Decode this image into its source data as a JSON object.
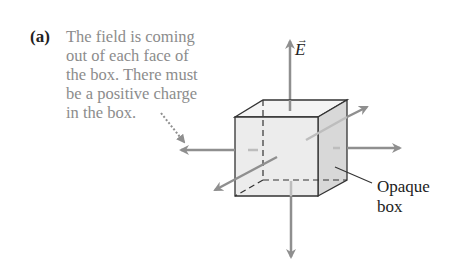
{
  "figure": {
    "panel_label": "(a)",
    "caption_lines": [
      "The field is coming",
      "out of each face of",
      "the box. There must",
      "be a positive charge",
      "in the box."
    ],
    "field_symbol": "E",
    "field_vector_mark": "→",
    "box_label_lines": [
      "Opaque",
      "box"
    ]
  },
  "colors": {
    "arrow": "#8f8f8f",
    "caption_text": "#8c8c8c",
    "box_front": "#ececec",
    "box_side": "#d8d8d8",
    "box_top": "#f4f4f4",
    "outline": "#333333"
  }
}
